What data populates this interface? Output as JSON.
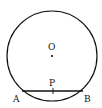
{
  "diagram": {
    "type": "circle-chord",
    "circle": {
      "center_label": "O",
      "cx": 52,
      "cy": 56,
      "r": 45
    },
    "chord": {
      "endpoints": [
        "A",
        "B"
      ],
      "x1": 22,
      "y1": 91,
      "x2": 83,
      "y2": 91
    },
    "point_on_chord": {
      "label": "P",
      "x": 53,
      "y": 91
    },
    "labels": {
      "O": "O",
      "P": "P",
      "A": "A",
      "B": "B"
    },
    "colors": {
      "stroke": "#111111",
      "background": "#ffffff"
    }
  }
}
